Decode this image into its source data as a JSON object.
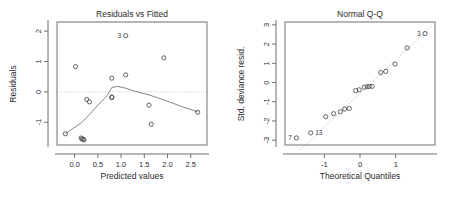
{
  "figure": {
    "background": "#ffffff",
    "panel_count": 2,
    "point_color": "#4a4a4a",
    "line_color": "#787878",
    "frame_color": "#6e6e6e",
    "reference_line_color": "#c9c9c9"
  },
  "chart_data": [
    {
      "type": "scatter",
      "id": "residuals-vs-fitted",
      "title": "Residuals vs Fitted",
      "xlabel": "Predicted values",
      "ylabel": "Residuals",
      "xlim": [
        -0.38,
        2.85
      ],
      "ylim": [
        -1.75,
        2.3
      ],
      "xticks": [
        0.0,
        0.5,
        1.0,
        1.5,
        2.0,
        2.5
      ],
      "xtick_labels": [
        "0.0",
        "0.5",
        "1.0",
        "1.5",
        "2.0",
        "2.5"
      ],
      "yticks": [
        -1,
        0,
        1,
        2
      ],
      "ytick_labels": [
        "-1",
        "0",
        "1",
        "2"
      ],
      "grid": false,
      "legend": "none",
      "reference_line": {
        "type": "horizontal",
        "y": 0,
        "style": "dotted"
      },
      "smoother": {
        "name": "loess",
        "x": [
          -0.2,
          0.16,
          0.3,
          0.5,
          0.7,
          0.8,
          0.92,
          1.1,
          1.3,
          1.6,
          1.95,
          2.3,
          2.65
        ],
        "y": [
          -1.38,
          -1.0,
          -0.78,
          -0.44,
          -0.12,
          0.14,
          0.18,
          0.12,
          0.02,
          -0.1,
          -0.28,
          -0.48,
          -0.66
        ]
      },
      "x": [
        -0.2,
        0.02,
        0.14,
        0.16,
        0.18,
        0.2,
        0.26,
        0.32,
        0.8,
        0.8,
        0.8,
        1.1,
        1.1,
        1.6,
        1.65,
        1.92,
        2.65
      ],
      "y": [
        -1.38,
        0.83,
        -1.52,
        -1.55,
        -1.56,
        -1.58,
        -0.25,
        -0.33,
        0.45,
        -0.17,
        -0.19,
        1.85,
        0.56,
        -0.44,
        -1.07,
        1.12,
        -0.67
      ],
      "point_labels": [
        {
          "label": "3",
          "x": 1.1,
          "y": 1.85,
          "position": "left"
        }
      ]
    },
    {
      "type": "scatter",
      "id": "normal-qq",
      "title": "Normal Q-Q",
      "xlabel": "Theoretical Quantiles",
      "ylabel": "Std. deviance resid.",
      "xlim": [
        -2.1,
        2.1
      ],
      "ylim": [
        -3.25,
        3.15
      ],
      "xticks": [
        -1,
        0,
        1
      ],
      "xtick_labels": [
        "-1",
        "0",
        "1"
      ],
      "yticks": [
        -3,
        -2,
        -1,
        0,
        1,
        2,
        3
      ],
      "ytick_labels": [
        "-3",
        "-2",
        "-1",
        "0",
        "1",
        "2",
        "3"
      ],
      "grid": false,
      "legend": "none",
      "reference_line": {
        "type": "qq",
        "style": "dotted"
      },
      "x": [
        -1.78,
        -1.38,
        -0.96,
        -0.74,
        -0.55,
        -0.43,
        -0.3,
        -0.12,
        -0.02,
        0.12,
        0.2,
        0.26,
        0.34,
        0.58,
        0.72,
        0.98,
        1.32,
        1.82
      ],
      "y": [
        -2.88,
        -2.62,
        -1.78,
        -1.62,
        -1.52,
        -1.38,
        -1.35,
        -0.42,
        -0.38,
        -0.24,
        -0.22,
        -0.2,
        -0.2,
        0.52,
        0.58,
        0.96,
        1.8,
        2.55
      ],
      "point_labels": [
        {
          "label": "7",
          "x": -1.78,
          "y": -2.88,
          "position": "left"
        },
        {
          "label": "13",
          "x": -1.38,
          "y": -2.62,
          "position": "right"
        },
        {
          "label": "3",
          "x": 1.82,
          "y": 2.55,
          "position": "left"
        }
      ]
    }
  ]
}
